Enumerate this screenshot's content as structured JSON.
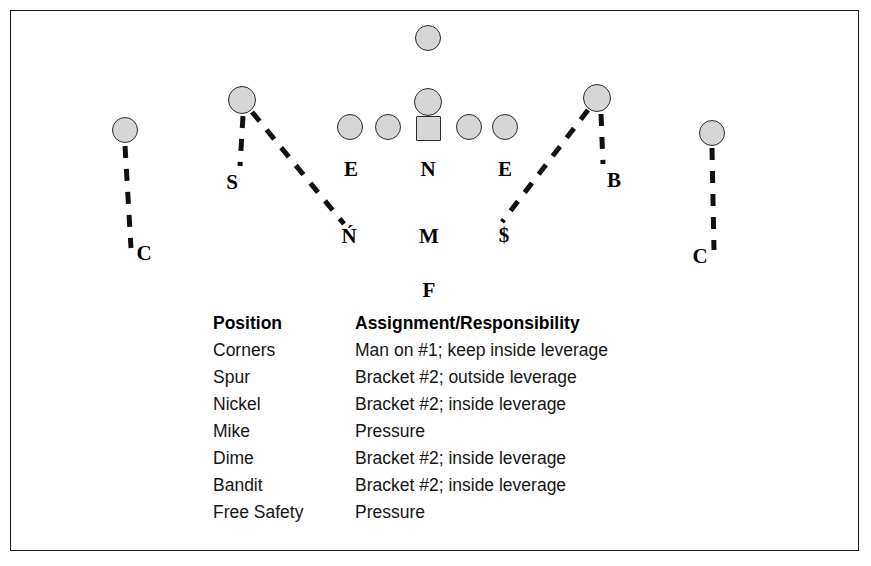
{
  "diagram": {
    "players": [
      {
        "name": "deep-safety-token",
        "shape": "circle",
        "x": 428,
        "y": 38,
        "size": 26
      },
      {
        "name": "left-corner-token",
        "shape": "circle",
        "x": 125,
        "y": 130,
        "size": 26
      },
      {
        "name": "right-corner-token",
        "shape": "circle",
        "x": 712,
        "y": 133,
        "size": 26
      },
      {
        "name": "spur-token",
        "shape": "circle",
        "x": 242,
        "y": 100,
        "size": 28
      },
      {
        "name": "bandit-token",
        "shape": "circle",
        "x": 597,
        "y": 98,
        "size": 28
      },
      {
        "name": "nose-deep-token",
        "shape": "circle",
        "x": 428,
        "y": 102,
        "size": 28
      },
      {
        "name": "left-end-token",
        "shape": "circle",
        "x": 350,
        "y": 127,
        "size": 26
      },
      {
        "name": "left-tackle-token",
        "shape": "circle",
        "x": 388,
        "y": 127,
        "size": 26
      },
      {
        "name": "center-ball-token",
        "shape": "square",
        "x": 428,
        "y": 128,
        "size": 25
      },
      {
        "name": "right-tackle-token",
        "shape": "circle",
        "x": 469,
        "y": 127,
        "size": 26
      },
      {
        "name": "right-end-token",
        "shape": "circle",
        "x": 505,
        "y": 127,
        "size": 26
      }
    ],
    "labels": [
      {
        "name": "label-spur",
        "text": "S",
        "x": 232,
        "y": 182
      },
      {
        "name": "label-left-end",
        "text": "E",
        "x": 351,
        "y": 169
      },
      {
        "name": "label-nose",
        "text": "N",
        "x": 428,
        "y": 169
      },
      {
        "name": "label-right-end",
        "text": "E",
        "x": 505,
        "y": 169
      },
      {
        "name": "label-bandit",
        "text": "B",
        "x": 614,
        "y": 180
      },
      {
        "name": "label-nickel",
        "text": "Ń",
        "x": 349,
        "y": 236
      },
      {
        "name": "label-mike",
        "text": "M",
        "x": 429,
        "y": 236
      },
      {
        "name": "label-dime",
        "text": "$",
        "x": 504,
        "y": 235
      },
      {
        "name": "label-free-safety",
        "text": "F",
        "x": 429,
        "y": 290
      },
      {
        "name": "label-left-corner",
        "text": "C",
        "x": 144,
        "y": 253
      },
      {
        "name": "label-right-corner",
        "text": "C",
        "x": 700,
        "y": 256
      }
    ],
    "routes": [
      {
        "name": "left-corner-drop-line",
        "x1": 125,
        "y1": 146,
        "x2": 131,
        "y2": 248
      },
      {
        "name": "right-corner-drop-line",
        "x1": 712,
        "y1": 148,
        "x2": 714,
        "y2": 250
      },
      {
        "name": "spur-drop-line",
        "x1": 243,
        "y1": 116,
        "x2": 240,
        "y2": 166
      },
      {
        "name": "spur-to-nickel-line",
        "x1": 252,
        "y1": 112,
        "x2": 344,
        "y2": 224
      },
      {
        "name": "bandit-drop-line",
        "x1": 601,
        "y1": 114,
        "x2": 603,
        "y2": 164
      },
      {
        "name": "bandit-to-dime-line",
        "x1": 588,
        "y1": 110,
        "x2": 502,
        "y2": 222
      }
    ],
    "colors": {
      "token_fill": "#d6d6d6",
      "token_stroke": "#2a2a2a",
      "route_stroke": "#111111",
      "frame": "#1b1b1b"
    }
  },
  "assignments": {
    "headers": {
      "position": "Position",
      "assignment": "Assignment/Responsibility"
    },
    "rows": [
      {
        "position": "Corners",
        "assignment": "Man on #1; keep inside leverage"
      },
      {
        "position": "Spur",
        "assignment": "Bracket #2; outside leverage"
      },
      {
        "position": "Nickel",
        "assignment": "Bracket #2; inside leverage"
      },
      {
        "position": "Mike",
        "assignment": "Pressure"
      },
      {
        "position": "Dime",
        "assignment": "Bracket #2; inside leverage"
      },
      {
        "position": "Bandit",
        "assignment": "Bracket #2; inside leverage"
      },
      {
        "position": "Free Safety",
        "assignment": "Pressure"
      }
    ]
  }
}
